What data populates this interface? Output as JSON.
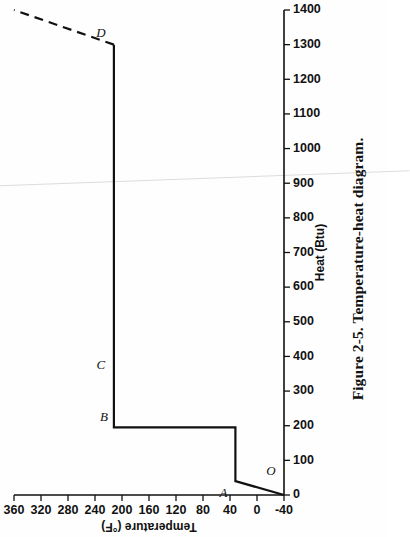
{
  "figure": {
    "caption": "Figure 2-5. Temperature-heat diagram.",
    "rotation_degrees": -90,
    "page_background": "#fefefe",
    "ink_color": "#111111"
  },
  "chart_data": {
    "type": "line",
    "title": "Temperature-heat diagram",
    "xlabel": "Heat (Btu)",
    "ylabel": "Temperature (°F)",
    "xlim": [
      0,
      1400
    ],
    "ylim": [
      -40,
      360
    ],
    "xticks": [
      0,
      100,
      200,
      300,
      400,
      500,
      600,
      700,
      800,
      900,
      1000,
      1100,
      1200,
      1300,
      1400
    ],
    "xticklabels": [
      "0",
      "100",
      "200",
      "300",
      "400",
      "500",
      "600",
      "700",
      "800",
      "900",
      "1000",
      "1100",
      "1200",
      "1300",
      "1400"
    ],
    "yticks": [
      -40,
      0,
      40,
      80,
      120,
      160,
      200,
      240,
      280,
      320,
      360
    ],
    "yticklabels": [
      "-40",
      "0",
      "40",
      "80",
      "120",
      "160",
      "200",
      "240",
      "280",
      "320",
      "360"
    ],
    "grid": false,
    "legend": null,
    "series": [
      {
        "name": "solid-process-path",
        "style": "solid",
        "linewidth": 2.2,
        "x": [
          0,
          40,
          40,
          195,
          195,
          340,
          340,
          1300
        ],
        "y": [
          -40,
          32,
          32,
          32,
          212,
          212,
          212,
          212
        ]
      },
      {
        "name": "superheat-extension",
        "style": "dashed",
        "linewidth": 2.2,
        "x": [
          1300,
          1400
        ],
        "y": [
          212,
          360
        ]
      }
    ],
    "annotations": [
      {
        "label": "O",
        "x": 40,
        "y": -40,
        "dx": 6,
        "dy": -13
      },
      {
        "label": "A",
        "x": 40,
        "y": 32,
        "dx": -16,
        "dy": -12
      },
      {
        "label": "B",
        "x": 195,
        "y": 212,
        "dx": 6,
        "dy": -10
      },
      {
        "label": "C",
        "x": 340,
        "y": 212,
        "dx": 8,
        "dy": -13
      },
      {
        "label": "D",
        "x": 1300,
        "y": 212,
        "dx": 8,
        "dy": -13
      }
    ]
  }
}
